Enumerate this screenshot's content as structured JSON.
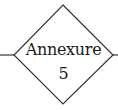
{
  "node": {
    "shape": "diamond",
    "line1": "Annexure",
    "line2": "5",
    "stroke_color": "#333333"
  },
  "connectors": {
    "left": "incoming-line",
    "right": "outgoing-line"
  }
}
